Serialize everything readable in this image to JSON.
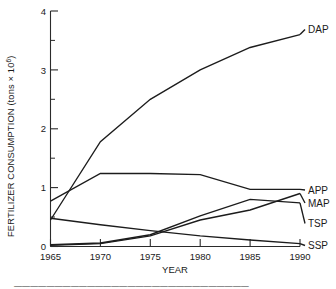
{
  "chart_data": {
    "type": "line",
    "title": "",
    "xlabel": "YEAR",
    "ylabel": "FERTILIZER CONSUMPTION (tons × 10⁶)",
    "ylabel_main": "FERTILIZER CONSUMPTION (tons × 10",
    "ylabel_exponent": "6",
    "ylabel_tail": ")",
    "x": [
      1965,
      1970,
      1975,
      1980,
      1985,
      1990
    ],
    "xlim": [
      1965,
      1990
    ],
    "ylim": [
      0,
      4
    ],
    "xticklabels": [
      "1965",
      "1970",
      "1975",
      "1980",
      "1985",
      "1990"
    ],
    "yticklabels": [
      "0",
      "1",
      "2",
      "3",
      "4"
    ],
    "yticks": [
      0,
      1,
      2,
      3,
      4
    ],
    "yminorticks": [
      0.5,
      1.5,
      2.5,
      3.5
    ],
    "grid": false,
    "legend_position": "right-of-axis-inline-labels",
    "series": [
      {
        "name": "DAP",
        "label": "DAP",
        "values": [
          0.45,
          1.78,
          2.5,
          3.0,
          3.38,
          3.6
        ]
      },
      {
        "name": "APP",
        "label": "APP",
        "values": [
          0.77,
          1.24,
          1.24,
          1.22,
          0.97,
          0.97
        ]
      },
      {
        "name": "MAP",
        "label": "MAP",
        "values": [
          0.02,
          0.05,
          0.18,
          0.45,
          0.62,
          0.9
        ]
      },
      {
        "name": "TSP",
        "label": "TSP",
        "values": [
          0.03,
          0.06,
          0.2,
          0.52,
          0.8,
          0.74
        ]
      },
      {
        "name": "SSP",
        "label": "SSP",
        "values": [
          0.48,
          0.37,
          0.27,
          0.18,
          0.11,
          0.05
        ]
      }
    ]
  },
  "caption": {
    "partial_line": "—————————————————————————————"
  }
}
